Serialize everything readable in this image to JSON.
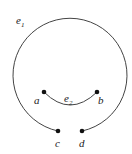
{
  "diagram": {
    "edges": [
      {
        "name": "e",
        "sub": "1",
        "from": "c",
        "to": "d",
        "shape": "large-loop"
      },
      {
        "name": "e",
        "sub": "2",
        "from": "a",
        "to": "b",
        "shape": "arc"
      }
    ],
    "vertices": [
      {
        "label": "a",
        "x": 44,
        "y": 92
      },
      {
        "label": "b",
        "x": 97,
        "y": 92
      },
      {
        "label": "c",
        "x": 58,
        "y": 131
      },
      {
        "label": "d",
        "x": 82,
        "y": 131
      }
    ],
    "colors": {
      "stroke": "#444444",
      "vertex": "#111111"
    }
  }
}
